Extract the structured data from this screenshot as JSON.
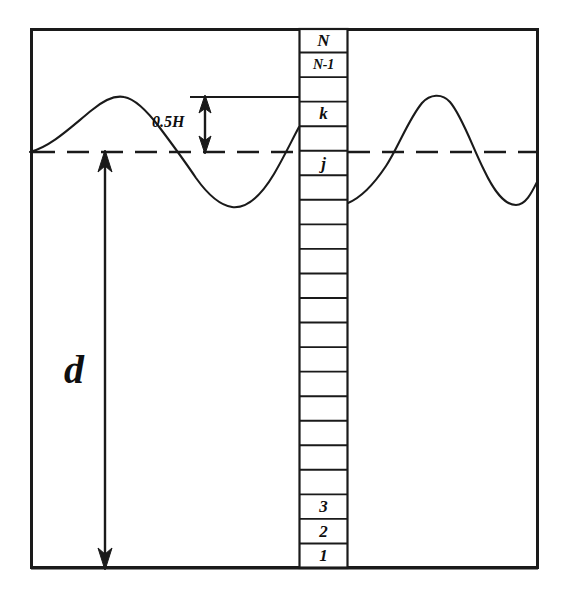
{
  "figure": {
    "type": "schematic-diagram",
    "colors": {
      "stroke": "#1a1a1a",
      "background": "#ffffff",
      "text": "#0f0f0f"
    }
  },
  "frame": {
    "name": "outer-domain-border",
    "x": 30,
    "y": 28,
    "width": 508,
    "height": 540,
    "stroke_width": 3
  },
  "still_water_line": {
    "label": "",
    "y": 152,
    "style": "dashed",
    "dash": "22 12"
  },
  "seabed": {
    "label": "",
    "y": 568
  },
  "annotations": {
    "depth": {
      "label": "d",
      "arrow_x": 105,
      "arrow_top": 152,
      "arrow_bottom": 568,
      "label_x": 64,
      "label_y": 350
    },
    "wave_height": {
      "label": "0.5H",
      "arrow_x": 205,
      "arrow_top": 97,
      "arrow_bottom": 152,
      "label_x": 152,
      "label_y": 114
    }
  },
  "ladder": {
    "name": "vertical-layer-column",
    "x": 299,
    "width": 49,
    "top": 28,
    "bottom": 568,
    "cell_count": 22,
    "labeled_cells": [
      {
        "index": 22,
        "label": "N",
        "size": "normal"
      },
      {
        "index": 21,
        "label": "N-1",
        "size": "small"
      },
      {
        "index": 19,
        "label": "k",
        "size": "normal"
      },
      {
        "index": 17,
        "label": "j",
        "size": "normal"
      },
      {
        "index": 3,
        "label": "3",
        "size": "normal"
      },
      {
        "index": 2,
        "label": "2",
        "size": "normal"
      },
      {
        "index": 1,
        "label": "1",
        "size": "normal"
      }
    ]
  },
  "chart_data": {
    "type": "line",
    "xlabel": "",
    "ylabel": "",
    "xlim": [
      30,
      538
    ],
    "ylim": [
      568,
      28
    ],
    "grid": false,
    "legend": null,
    "series": [
      {
        "name": "free-surface-left",
        "comment": "sinusoidal free surface left of the column",
        "points": [
          [
            30,
            152
          ],
          [
            48,
            146
          ],
          [
            66,
            133
          ],
          [
            84,
            118
          ],
          [
            102,
            104
          ],
          [
            122,
            97
          ],
          [
            142,
            103
          ],
          [
            160,
            117
          ],
          [
            178,
            136
          ],
          [
            195,
            152
          ],
          [
            205,
            168
          ],
          [
            215,
            186
          ],
          [
            228,
            200
          ],
          [
            244,
            207
          ],
          [
            258,
            203
          ],
          [
            270,
            190
          ],
          [
            282,
            170
          ],
          [
            292,
            148
          ],
          [
            299,
            130
          ]
        ]
      },
      {
        "name": "free-surface-right",
        "comment": "sinusoidal free surface right of the column",
        "points": [
          [
            348,
            203
          ],
          [
            362,
            194
          ],
          [
            376,
            180
          ],
          [
            388,
            163
          ],
          [
            398,
            144
          ],
          [
            410,
            122
          ],
          [
            422,
            104
          ],
          [
            436,
            97
          ],
          [
            450,
            101
          ],
          [
            462,
            117
          ],
          [
            474,
            140
          ],
          [
            484,
            165
          ],
          [
            494,
            187
          ],
          [
            506,
            202
          ],
          [
            518,
            205
          ],
          [
            528,
            196
          ],
          [
            538,
            180
          ]
        ]
      }
    ],
    "reference_lines": [
      {
        "name": "still-water-level",
        "y": 152,
        "style": "dashed"
      },
      {
        "name": "crest-level-tick",
        "y": 97,
        "style": "solid",
        "x_from": 190,
        "x_to": 299
      },
      {
        "name": "swl-tick-left",
        "y": 152,
        "style": "solid",
        "x_from": 190,
        "x_to": 230
      }
    ]
  }
}
